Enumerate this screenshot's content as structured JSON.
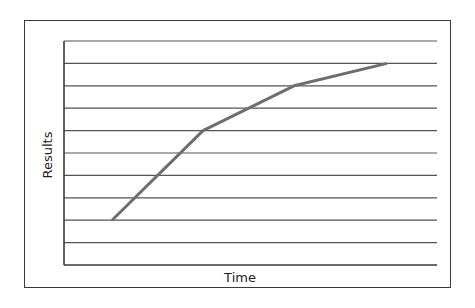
{
  "chart_data": {
    "type": "line",
    "title": "",
    "xlabel": "Time",
    "ylabel": "Results",
    "x": [
      1,
      2,
      3,
      4
    ],
    "series": [
      {
        "name": "Results",
        "values": [
          2,
          6,
          8,
          9
        ],
        "color": "#6e6e6e"
      }
    ],
    "ylim": [
      0,
      10
    ],
    "xlim": [
      0,
      8
    ],
    "grid": {
      "horizontal": true,
      "vertical": false,
      "lines": 10
    },
    "tick_labels": {
      "x": [],
      "y": []
    },
    "legend": null
  },
  "colors": {
    "frame": "#3a3a3a",
    "axis": "#3a3a3a",
    "grid": "#555555",
    "line": "#6e6e6e"
  }
}
